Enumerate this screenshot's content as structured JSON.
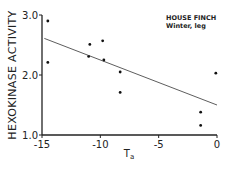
{
  "chart_data": {
    "type": "scatter",
    "title": "",
    "annotation": [
      "HOUSE FINCH",
      "Winter, leg"
    ],
    "xlabel": "T",
    "xlabel_subscript": "a",
    "ylabel": "HEXOKINASE ACTIVITY",
    "xlim": [
      -15,
      0
    ],
    "ylim": [
      1.0,
      3.0
    ],
    "xticks": [
      "-15",
      "-10",
      "-5",
      "0"
    ],
    "yticks": [
      "1.0",
      "2.0",
      "3.0"
    ],
    "grid": false,
    "legend_position": "upper right",
    "series": [
      {
        "name": "House Finch, winter, leg",
        "points": [
          {
            "x": -14.5,
            "y": 2.9
          },
          {
            "x": -14.5,
            "y": 2.21
          },
          {
            "x": -10.9,
            "y": 2.51
          },
          {
            "x": -11.0,
            "y": 2.31
          },
          {
            "x": -9.8,
            "y": 2.57
          },
          {
            "x": -9.7,
            "y": 2.25
          },
          {
            "x": -8.3,
            "y": 2.05
          },
          {
            "x": -8.3,
            "y": 1.71
          },
          {
            "x": -1.4,
            "y": 1.38
          },
          {
            "x": -1.4,
            "y": 1.16
          },
          {
            "x": -0.1,
            "y": 2.03
          }
        ]
      }
    ],
    "regression_line": {
      "x": [
        -14.8,
        0
      ],
      "y": [
        2.61,
        1.5
      ]
    }
  }
}
